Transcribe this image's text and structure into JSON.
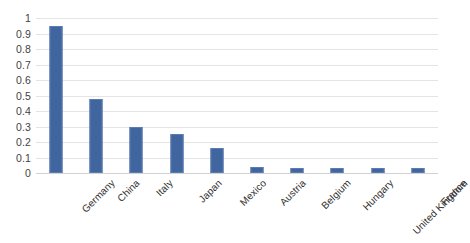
{
  "chart_data": {
    "type": "bar",
    "title": "",
    "subtitle": "",
    "xlabel": "",
    "ylabel": "",
    "ylim": [
      0,
      1
    ],
    "y_ticks": [
      "0",
      "0.1",
      "0.2",
      "0.3",
      "0.4",
      "0.5",
      "0.6",
      "0.7",
      "0.8",
      "0.9",
      "1"
    ],
    "grid": true,
    "legend": false,
    "legend_position": "none",
    "series_color": "#41659e",
    "categories": [
      "Germany",
      "China",
      "Italy",
      "Japan",
      "Mexico",
      "Austria",
      "Belgium",
      "Hungary",
      "United Kingdom",
      "France"
    ],
    "values": [
      0.95,
      0.48,
      0.3,
      0.25,
      0.16,
      0.04,
      0.035,
      0.03,
      0.03,
      0.03
    ]
  }
}
